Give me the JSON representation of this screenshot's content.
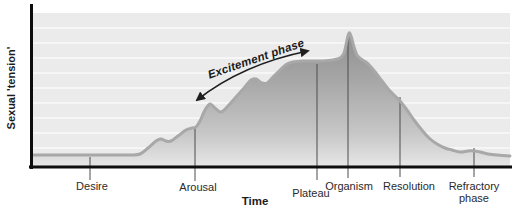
{
  "figure": {
    "y_axis_label": "Sexual 'tension'",
    "x_axis_label": "Time",
    "annotation": "Excitement phase"
  },
  "colors": {
    "plot_background": "#ebebeb",
    "gridline": "#ffffff",
    "area_fill_top": "#8f8f8f",
    "area_fill_bottom": "#e6e6e6",
    "curve_stroke": "#a8a8a8",
    "axis": "#0d0d0d",
    "tick_line": "#4d4d4d",
    "text": "#2a2a2a"
  },
  "chart_data": {
    "type": "area",
    "title": "",
    "xlabel": "Time",
    "ylabel": "Sexual 'tension'",
    "x_axis_type": "qualitative-time",
    "y_axis_type": "qualitative-intensity",
    "grid": "horizontal-white-lines",
    "legend": "none",
    "annotations": [
      {
        "text": "Excitement phase",
        "style": "bold-italic-rotated",
        "arrow": "double-headed curved arrow spanning rise from Arousal to Plateau"
      }
    ],
    "phases": [
      {
        "label": "Desire",
        "x_px": 90,
        "tension_pct": 9
      },
      {
        "label": "Arousal",
        "x_px": 195,
        "tension_pct": 30
      },
      {
        "label": "Plateau",
        "x_px": 317,
        "tension_pct": 79
      },
      {
        "label": "Organism",
        "x_px": 348,
        "tension_pct": 100
      },
      {
        "label": "Resolution",
        "x_px": 400,
        "tension_pct": 49
      },
      {
        "label": "Refractory phase",
        "x_px": 474,
        "tension_pct": 12
      }
    ],
    "ticks_px": [
      {
        "x": 90,
        "y1": 157,
        "y2": 180
      },
      {
        "x": 195,
        "y1": 128,
        "y2": 181
      },
      {
        "x": 317,
        "y1": 64,
        "y2": 180
      },
      {
        "x": 348,
        "y1": 37,
        "y2": 178
      },
      {
        "x": 400,
        "y1": 97,
        "y2": 177
      },
      {
        "x": 474,
        "y1": 148,
        "y2": 177
      }
    ],
    "plot_px": {
      "left": 33,
      "right": 510,
      "top": 13,
      "bottom": 166
    },
    "gridline_y_px": [
      28,
      43,
      58,
      73,
      88,
      103,
      118,
      133,
      148
    ],
    "curve_px": [
      [
        33,
        155
      ],
      [
        70,
        155
      ],
      [
        105,
        155
      ],
      [
        130,
        155
      ],
      [
        140,
        154
      ],
      [
        148,
        148
      ],
      [
        156,
        141
      ],
      [
        161,
        139
      ],
      [
        166,
        141
      ],
      [
        171,
        141
      ],
      [
        178,
        136
      ],
      [
        186,
        130
      ],
      [
        192,
        128
      ],
      [
        196,
        127
      ],
      [
        200,
        121
      ],
      [
        205,
        110
      ],
      [
        210,
        104
      ],
      [
        215,
        108
      ],
      [
        221,
        112
      ],
      [
        228,
        106
      ],
      [
        236,
        97
      ],
      [
        244,
        88
      ],
      [
        251,
        80
      ],
      [
        256,
        79
      ],
      [
        262,
        83
      ],
      [
        267,
        83
      ],
      [
        273,
        77
      ],
      [
        280,
        70
      ],
      [
        287,
        64
      ],
      [
        293,
        62
      ],
      [
        303,
        61
      ],
      [
        313,
        61
      ],
      [
        323,
        61
      ],
      [
        333,
        60
      ],
      [
        340,
        58
      ],
      [
        344,
        53
      ],
      [
        347,
        40
      ],
      [
        349,
        33
      ],
      [
        351,
        36
      ],
      [
        354,
        47
      ],
      [
        357,
        55
      ],
      [
        361,
        59
      ],
      [
        366,
        62
      ],
      [
        371,
        67
      ],
      [
        376,
        73
      ],
      [
        382,
        81
      ],
      [
        389,
        90
      ],
      [
        395,
        96
      ],
      [
        400,
        101
      ],
      [
        407,
        110
      ],
      [
        414,
        120
      ],
      [
        421,
        129
      ],
      [
        429,
        138
      ],
      [
        437,
        144
      ],
      [
        445,
        148
      ],
      [
        452,
        150
      ],
      [
        460,
        152
      ],
      [
        468,
        151
      ],
      [
        474,
        151
      ],
      [
        480,
        152
      ],
      [
        488,
        154
      ],
      [
        497,
        155
      ],
      [
        510,
        156
      ]
    ]
  }
}
